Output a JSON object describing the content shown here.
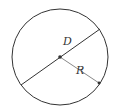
{
  "diagram": {
    "type": "circle-diameter-radius",
    "labels": {
      "diameter": "D",
      "radius": "R"
    },
    "colors": {
      "circle": "#333333",
      "diameter": "#333333",
      "radius": "#777777",
      "center": "#333333"
    }
  }
}
